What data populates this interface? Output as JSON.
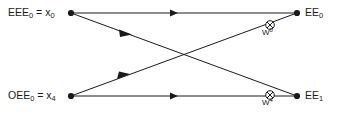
{
  "diagram": {
    "type": "fft-butterfly",
    "title": "",
    "stroke_color": "#1a1a1a",
    "background_color": "#ffffff",
    "nodes": [
      {
        "id": "in-top",
        "label_main": "EEE",
        "label_sub": "0",
        "label_eq": " = x",
        "label_eq_sub": "0",
        "x": 71,
        "y": 13
      },
      {
        "id": "in-bot",
        "label_main": "OEE",
        "label_sub": "0",
        "label_eq": " = x",
        "label_eq_sub": "4",
        "x": 71,
        "y": 96
      },
      {
        "id": "out-top",
        "label_main": "EE",
        "label_sub": "0",
        "label_eq": "",
        "label_eq_sub": "",
        "x": 297,
        "y": 13
      },
      {
        "id": "out-bot",
        "label_main": "EE",
        "label_sub": "1",
        "label_eq": "",
        "label_eq_sub": "",
        "x": 297,
        "y": 96
      }
    ],
    "labels": {
      "in_top": "EEE0 = x0",
      "in_bot": "OEE0 = x4",
      "out_top": "EE0",
      "out_bot": "EE1"
    },
    "edges": [
      {
        "id": "edge-in-top-to-out-top",
        "from": "in-top",
        "to": "out-top",
        "kind": "horizontal",
        "arrow_at": [
          176,
          13
        ]
      },
      {
        "id": "edge-in-bot-to-out-bot",
        "from": "in-bot",
        "to": "out-bot",
        "kind": "horizontal",
        "arrow_at": [
          176,
          96
        ]
      },
      {
        "id": "edge-in-top-to-out-bot",
        "from": "in-top",
        "to": "out-bot",
        "kind": "diagonal-down",
        "arrow_at": [
          126,
          33
        ]
      },
      {
        "id": "edge-in-bot-to-out-top",
        "from": "in-bot",
        "to": "out-top",
        "kind": "diagonal-up",
        "arrow_at": [
          124,
          75
        ]
      }
    ],
    "multipliers": [
      {
        "id": "twiddle-w0",
        "symbol": "circled-times",
        "label_base": "W",
        "label_exp": "0",
        "x": 270,
        "y": 25,
        "on_edge": "edge-in-bot-to-out-top"
      },
      {
        "id": "twiddle-w4",
        "symbol": "circled-times",
        "label_base": "W",
        "label_exp": "4",
        "x": 270,
        "y": 95,
        "on_edge": "edge-in-bot-to-out-bot"
      }
    ],
    "twiddle_text": {
      "w0": "W0",
      "w4": "W4"
    }
  }
}
